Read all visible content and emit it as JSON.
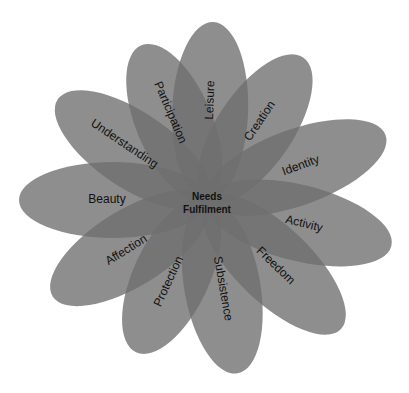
{
  "diagram": {
    "type": "flower",
    "center": {
      "line1": "Needs",
      "line2": "Fulfilment"
    },
    "petal_color": "#8a8a8a",
    "petals": [
      {
        "label": "Leisure"
      },
      {
        "label": "Creation"
      },
      {
        "label": "Identity"
      },
      {
        "label": "Activity"
      },
      {
        "label": "Freedom"
      },
      {
        "label": "Subsistence"
      },
      {
        "label": "Protection"
      },
      {
        "label": "Affection"
      },
      {
        "label": "Beauty"
      },
      {
        "label": "Understanding"
      },
      {
        "label": "Participation"
      }
    ]
  }
}
